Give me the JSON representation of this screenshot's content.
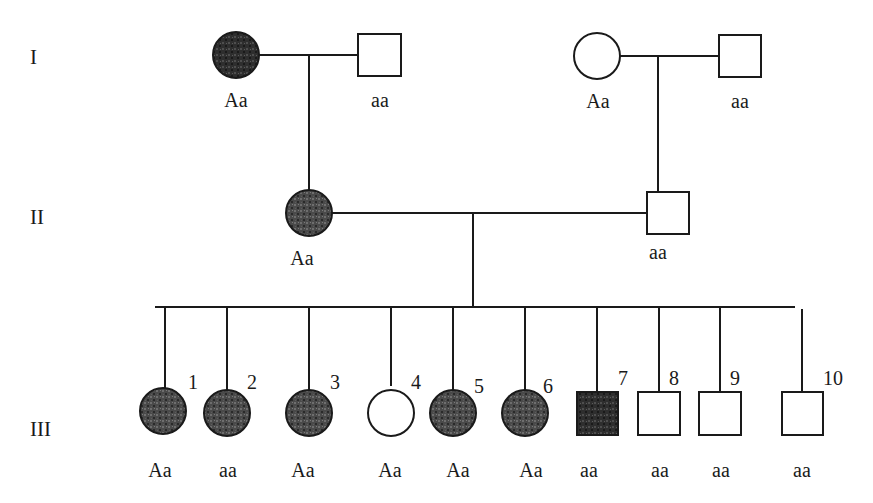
{
  "diagram": {
    "type": "pedigree",
    "colors": {
      "line": "#1a1a1a",
      "affected_fill": "#3a3a3a",
      "unaffected_fill": "#ffffff",
      "background": "#ffffff"
    },
    "generations": [
      {
        "label": "I"
      },
      {
        "label": "II"
      },
      {
        "label": "III"
      }
    ],
    "individuals": {
      "I": [
        {
          "id": "I-1",
          "sex": "female",
          "affected": true,
          "genotype": "Aa"
        },
        {
          "id": "I-2",
          "sex": "male",
          "affected": false,
          "genotype": "aa"
        },
        {
          "id": "I-3",
          "sex": "female",
          "affected": false,
          "genotype": "Aa"
        },
        {
          "id": "I-4",
          "sex": "male",
          "affected": false,
          "genotype": "aa"
        }
      ],
      "II": [
        {
          "id": "II-1",
          "sex": "female",
          "affected": true,
          "genotype": "Aa"
        },
        {
          "id": "II-2",
          "sex": "male",
          "affected": false,
          "genotype": "aa"
        }
      ],
      "III": [
        {
          "number": "1",
          "sex": "female",
          "affected": true,
          "genotype": "Aa"
        },
        {
          "number": "2",
          "sex": "female",
          "affected": true,
          "genotype": "aa"
        },
        {
          "number": "3",
          "sex": "female",
          "affected": true,
          "genotype": "Aa"
        },
        {
          "number": "4",
          "sex": "female",
          "affected": false,
          "genotype": "Aa"
        },
        {
          "number": "5",
          "sex": "female",
          "affected": true,
          "genotype": "Aa"
        },
        {
          "number": "6",
          "sex": "female",
          "affected": true,
          "genotype": "Aa"
        },
        {
          "number": "7",
          "sex": "male",
          "affected": true,
          "genotype": "aa"
        },
        {
          "number": "8",
          "sex": "male",
          "affected": false,
          "genotype": "aa"
        },
        {
          "number": "9",
          "sex": "male",
          "affected": false,
          "genotype": "aa"
        },
        {
          "number": "10",
          "sex": "male",
          "affected": false,
          "genotype": "aa"
        }
      ]
    }
  }
}
